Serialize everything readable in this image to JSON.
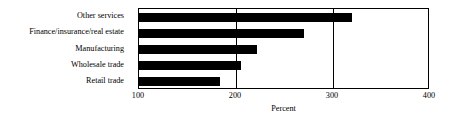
{
  "chart_data": {
    "type": "bar",
    "orientation": "horizontal",
    "title": "",
    "subtitle": "",
    "xlabel": "Percent",
    "ylabel": "",
    "categories": [
      "Other services",
      "Finance/insurance/real estate",
      "Manufacturing",
      "Wholesale trade",
      "Retail trade"
    ],
    "values": [
      320,
      270,
      222,
      205,
      183
    ],
    "xlim": [
      100,
      400
    ],
    "xticks": [
      100,
      200,
      300,
      400
    ],
    "xtick_labels": [
      "100",
      "200",
      "300",
      "400"
    ],
    "grid": "vertical",
    "gridlines_at": [
      200,
      300
    ],
    "legend": null,
    "bar_color": "#000000",
    "frame_color": "#000000",
    "background_color": "#ffffff",
    "annotations": []
  },
  "axis": {
    "x_title": "Percent",
    "tick_labels": [
      "100",
      "200",
      "300",
      "400"
    ]
  }
}
